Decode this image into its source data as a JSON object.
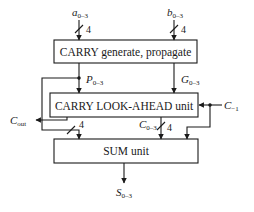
{
  "diagram": {
    "blocks": [
      {
        "id": "carry-gen-prop",
        "label": "CARRY generate, propagate"
      },
      {
        "id": "carry-lookahead",
        "label": "CARRY LOOK-AHEAD unit"
      },
      {
        "id": "sum-unit",
        "label": "SUM unit"
      }
    ],
    "signals": {
      "a_input": {
        "base": "a",
        "sub": "0–3"
      },
      "b_input": {
        "base": "b",
        "sub": "0–3"
      },
      "p_signal": {
        "base": "P",
        "sub": "0–3"
      },
      "g_signal": {
        "base": "G",
        "sub": "0–3"
      },
      "c_minus1": {
        "base": "C",
        "sub": "−1"
      },
      "c_out": {
        "base": "C",
        "sub": "out"
      },
      "c_0_3": {
        "base": "C",
        "sub": "0–3"
      },
      "s_output": {
        "base": "S",
        "sub": "0–3"
      }
    },
    "bus_widths": {
      "a": "4",
      "b": "4",
      "p_to_sum": "4",
      "c_to_sum": "4"
    }
  }
}
